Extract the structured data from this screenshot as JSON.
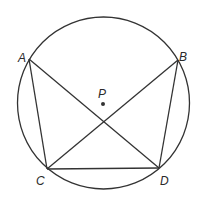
{
  "diagram": {
    "circle": {
      "cx": 103.5,
      "cy": 103,
      "r": 86
    },
    "points": {
      "A": {
        "label": "A",
        "x": 29,
        "y": 59,
        "lx": 18,
        "ly": 58
      },
      "B": {
        "label": "B",
        "x": 178,
        "y": 60,
        "lx": 180,
        "ly": 57
      },
      "C": {
        "label": "C",
        "x": 47,
        "y": 169,
        "lx": 36,
        "ly": 182
      },
      "D": {
        "label": "D",
        "x": 159,
        "y": 168,
        "lx": 160,
        "ly": 182
      },
      "P": {
        "label": "P",
        "x": 103,
        "y": 104,
        "lx": 98,
        "ly": 97
      }
    },
    "segments": [
      [
        "A",
        "C"
      ],
      [
        "A",
        "D"
      ],
      [
        "B",
        "C"
      ],
      [
        "B",
        "D"
      ],
      [
        "C",
        "D"
      ]
    ],
    "colors": {
      "stroke": "#333333",
      "background": "#ffffff"
    }
  }
}
